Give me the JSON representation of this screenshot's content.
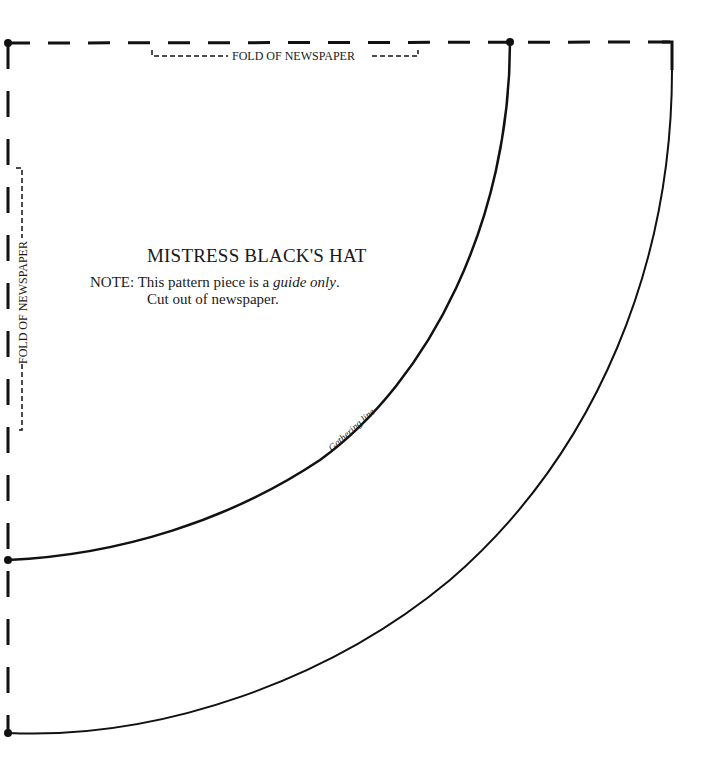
{
  "pattern": {
    "title": "MISTRESS BLACK'S HAT",
    "note_prefix": "NOTE:",
    "note_line1_pre": "This pattern piece is a ",
    "note_line1_italic": "guide only",
    "note_line1_post": ".",
    "note_line2": "Cut out of newspaper.",
    "fold_top_label": "FOLD OF NEWSPAPER",
    "fold_left_label": "FOLD OF NEWSPAPER",
    "gathering_label": "Gathering line",
    "line_color": "#111111",
    "background": "#ffffff"
  }
}
